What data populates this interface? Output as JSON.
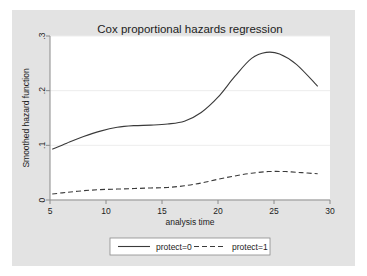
{
  "figure": {
    "background_color": "#e3e3e3",
    "plot_background_color": "#ffffff",
    "axis_color": "#8a8a8a",
    "grid_color": "#ededed",
    "line_color": "#3a3a3a",
    "text_color": "#1c1c1c"
  },
  "chart_data": {
    "type": "line",
    "title": "Cox proportional hazards regression",
    "xlabel": "analysis time",
    "ylabel": "Smoothed hazard function",
    "xlim": [
      5,
      30
    ],
    "ylim": [
      0,
      0.3
    ],
    "xticks": [
      5,
      10,
      15,
      20,
      25,
      30
    ],
    "xtick_labels": [
      "5",
      "10",
      "15",
      "20",
      "25",
      "30"
    ],
    "yticks": [
      0,
      0.1,
      0.2,
      0.3
    ],
    "ytick_labels": [
      "0",
      ".1",
      ".2",
      ".3"
    ],
    "grid": "horizontal",
    "legend_position": "bottom",
    "series": [
      {
        "name": "protect=0",
        "style": "solid",
        "x": [
          5.2,
          6.5,
          8.0,
          9.5,
          11.0,
          12.5,
          14.0,
          15.5,
          17.0,
          18.5,
          20.0,
          21.5,
          23.0,
          24.3,
          25.5,
          27.0,
          28.9
        ],
        "values": [
          0.093,
          0.104,
          0.116,
          0.126,
          0.133,
          0.136,
          0.137,
          0.139,
          0.144,
          0.16,
          0.188,
          0.226,
          0.259,
          0.27,
          0.267,
          0.248,
          0.208
        ]
      },
      {
        "name": "protect=1",
        "style": "dashed",
        "x": [
          5.2,
          6.5,
          8.0,
          9.5,
          11.0,
          12.5,
          14.0,
          15.5,
          17.0,
          18.5,
          20.0,
          21.5,
          23.0,
          24.5,
          26.0,
          27.5,
          28.9
        ],
        "values": [
          0.011,
          0.014,
          0.017,
          0.019,
          0.02,
          0.021,
          0.022,
          0.023,
          0.026,
          0.031,
          0.038,
          0.044,
          0.049,
          0.052,
          0.052,
          0.05,
          0.048
        ]
      }
    ],
    "legend": [
      {
        "label": "protect=0",
        "style": "solid"
      },
      {
        "label": "protect=1",
        "style": "dashed"
      }
    ]
  }
}
